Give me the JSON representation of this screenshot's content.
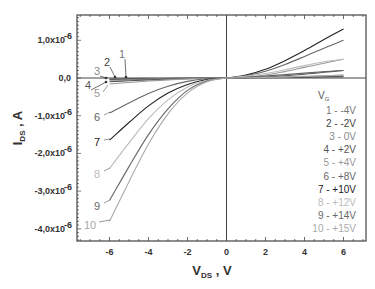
{
  "chart_data": {
    "type": "line",
    "title": "",
    "xlabel": "V_DS , V",
    "ylabel": "I_DS , A",
    "xlim": [
      -7.6,
      7.2
    ],
    "ylim": [
      -4.3e-06,
      1.67e-06
    ],
    "x_ticks": [
      -6,
      -4,
      -2,
      0,
      2,
      4,
      6
    ],
    "x_tick_labels": [
      "-6",
      "-4",
      "-2",
      "0",
      "2",
      "4",
      "6"
    ],
    "y_ticks": [
      1e-06,
      0,
      -1e-06,
      -2e-06,
      -3e-06,
      -4e-06
    ],
    "y_tick_labels": [
      "1,0x10",
      "0,0",
      "-1,0x10",
      "-2,0x10",
      "-3,0x10",
      "-4,0x10"
    ],
    "y_tick_exponents": [
      "-6",
      "",
      "-6",
      "-6",
      "-6",
      "-6"
    ],
    "grid": false,
    "legend_title": "V_G",
    "legend_position": "lower right",
    "x": [
      -6,
      -5,
      -4,
      -3,
      -2,
      -1,
      0,
      1,
      2,
      3,
      4,
      5,
      6
    ],
    "series": [
      {
        "name": "1",
        "vg": "-4V",
        "legend": "1 -  -4V",
        "color": "#777777",
        "values": [
          -2e-08,
          -1.5e-08,
          -1e-08,
          -6e-09,
          -3e-09,
          -1e-09,
          0,
          2e-09,
          5e-09,
          1e-08,
          1.5e-08,
          2e-08,
          2.5e-08
        ]
      },
      {
        "name": "2",
        "vg": "-2V",
        "legend": "2 -  -2V",
        "color": "#444444",
        "values": [
          -4e-08,
          -3e-08,
          -2e-08,
          -1.2e-08,
          -6e-09,
          -2e-09,
          0,
          3e-09,
          8e-09,
          1.5e-08,
          2.5e-08,
          3.5e-08,
          4.5e-08
        ]
      },
      {
        "name": "3",
        "vg": "0V",
        "legend": "3 -   0V",
        "color": "#888888",
        "values": [
          -6e-08,
          -4.5e-08,
          -3e-08,
          -1.8e-08,
          -9e-09,
          -3e-09,
          0,
          5e-09,
          1.2e-08,
          2.5e-08,
          4e-08,
          6e-08,
          8e-08
        ]
      },
      {
        "name": "4",
        "vg": "+2V",
        "legend": "4 -  +2V",
        "color": "#555555",
        "values": [
          -1e-07,
          -7.5e-08,
          -5e-08,
          -3e-08,
          -1.5e-08,
          -5e-09,
          0,
          1e-08,
          3e-08,
          6e-08,
          1e-07,
          1.5e-07,
          2e-07
        ]
      },
      {
        "name": "5",
        "vg": "+4V",
        "legend": "5 -  +4V",
        "color": "#999999",
        "values": [
          -1.6e-07,
          -1.2e-07,
          -8e-08,
          -5e-08,
          -2.5e-08,
          -8e-09,
          0,
          3e-08,
          8e-08,
          1.7e-07,
          2.8e-07,
          3.9e-07,
          5e-07
        ]
      },
      {
        "name": "6",
        "vg": "+8V",
        "legend": "6 -  +8V",
        "color": "#666666",
        "values": [
          -9.3e-07,
          -6.6e-07,
          -4.1e-07,
          -2.2e-07,
          -9e-08,
          -2e-08,
          0,
          6e-08,
          1.8e-07,
          3.6e-07,
          5.7e-07,
          7.9e-07,
          1e-06
        ]
      },
      {
        "name": "7",
        "vg": "+10V",
        "legend": "7 -  +10V",
        "color": "#222222",
        "values": [
          -1.65e-06,
          -1.18e-06,
          -7.4e-07,
          -4e-07,
          -1.7e-07,
          -4e-08,
          0,
          8e-08,
          2.3e-07,
          4.6e-07,
          7.3e-07,
          1.02e-06,
          1.3e-06
        ]
      },
      {
        "name": "8",
        "vg": "+12V",
        "legend": "8 -  +12V",
        "color": "#bbbbbb",
        "values": [
          -2.4e-06,
          -1.72e-06,
          -1.08e-06,
          -5.8e-07,
          -2.4e-07,
          -6e-08,
          0,
          5e-08,
          1.2e-07,
          2.2e-07,
          3.3e-07,
          4.3e-07,
          5e-07
        ]
      },
      {
        "name": "9",
        "vg": "+14V",
        "legend": "9 -  +14V",
        "color": "#666666",
        "values": [
          -3.25e-06,
          -2.35e-06,
          -1.5e-06,
          -8.2e-07,
          -3.3e-07,
          -8e-08,
          0,
          2e-08,
          5e-08,
          9e-08,
          1.3e-07,
          1.7e-07,
          2e-07
        ]
      },
      {
        "name": "10",
        "vg": "+15V",
        "legend": "10 -  +15V",
        "color": "#aaaaaa",
        "values": [
          -3.8e-06,
          -2.75e-06,
          -1.75e-06,
          -9.5e-07,
          -4e-07,
          -1e-07,
          0,
          5e-09,
          1.5e-08,
          3e-08,
          4.5e-08,
          6e-08,
          7e-08
        ]
      }
    ],
    "annotations": [
      {
        "text": "1",
        "x_px": 122,
        "y_px": 58,
        "arrow_to": [
          126,
          77
        ]
      },
      {
        "text": "2",
        "x_px": 107,
        "y_px": 66,
        "arrow_to": [
          115,
          77
        ]
      },
      {
        "text": "3",
        "x_px": 97,
        "y_px": 75,
        "arrow_to": [
          106,
          78
        ]
      },
      {
        "text": "4",
        "x_px": 88,
        "y_px": 89,
        "arrow_to": [
          106,
          82
        ]
      },
      {
        "text": "5",
        "x_px": 97,
        "y_px": 97
      },
      {
        "text": "6",
        "x_px": 97,
        "y_px": 121
      },
      {
        "text": "7",
        "x_px": 97,
        "y_px": 146
      },
      {
        "text": "8",
        "x_px": 97,
        "y_px": 178
      },
      {
        "text": "9",
        "x_px": 97,
        "y_px": 210
      },
      {
        "text": "10",
        "x_px": 90,
        "y_px": 229
      }
    ]
  }
}
